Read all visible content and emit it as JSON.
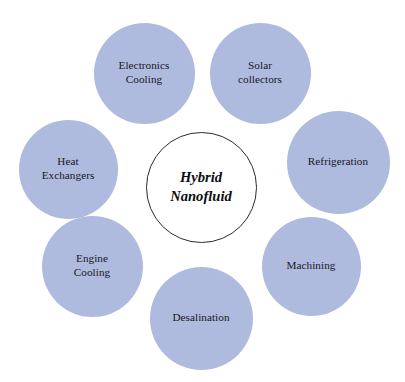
{
  "diagram": {
    "type": "radial-hub-and-spoke",
    "background_color": "#ffffff",
    "node_fill_color": "#aebbdf",
    "node_text_color": "#18181c",
    "center_fill_color": "#ffffff",
    "center_stroke_color": "#2a2a2a",
    "center": {
      "label": "Hybrid\nNanofluid",
      "line1": "Hybrid",
      "line2": "Nanofluid",
      "cx": 201,
      "cy": 187,
      "diameter": 111
    },
    "satellites": [
      {
        "id": "electronics-cooling",
        "label": "Electronics\nCooling",
        "cx": 144,
        "cy": 73,
        "diameter": 101
      },
      {
        "id": "solar-collectors",
        "label": "Solar\ncollectors",
        "cx": 260,
        "cy": 73,
        "diameter": 101
      },
      {
        "id": "refrigeration",
        "label": "Refrigeration",
        "cx": 338,
        "cy": 162,
        "diameter": 103
      },
      {
        "id": "machining",
        "label": "Machining",
        "cx": 311,
        "cy": 266,
        "diameter": 99
      },
      {
        "id": "desalination",
        "label": "Desalination",
        "cx": 201,
        "cy": 318,
        "diameter": 103
      },
      {
        "id": "engine-cooling",
        "label": "Engine\nCooling",
        "cx": 92,
        "cy": 266,
        "diameter": 101
      },
      {
        "id": "heat-exchangers",
        "label": "Heat\nExchangers",
        "cx": 68,
        "cy": 169,
        "diameter": 99
      }
    ]
  }
}
